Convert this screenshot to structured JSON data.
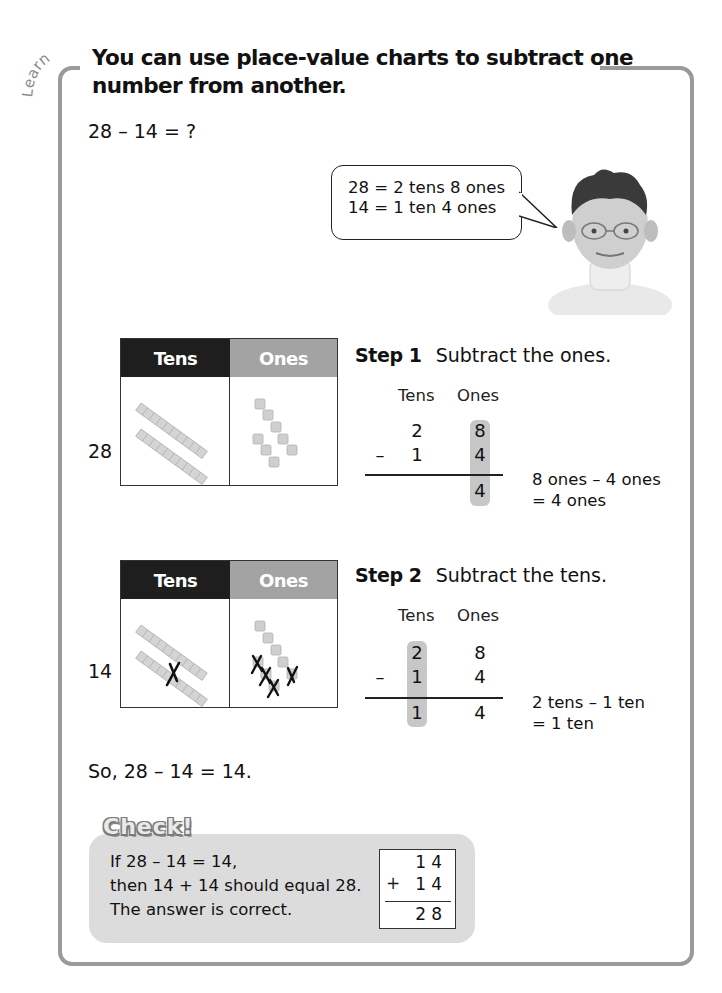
{
  "section_label": "Learn",
  "title": "You can use place-value charts to subtract one number from another.",
  "problem": "28 – 14 = ?",
  "speech_bubble": {
    "line1": "28 = 2 tens 8 ones",
    "line2": "14 = 1 ten 4 ones"
  },
  "charts": [
    {
      "number_label": "28",
      "header": {
        "tens": "Tens",
        "ones": "Ones"
      },
      "tens_rods": 2,
      "ones_cubes": 8,
      "crossed_tens": 0,
      "crossed_ones": 0
    },
    {
      "number_label": "14",
      "header": {
        "tens": "Tens",
        "ones": "Ones"
      },
      "tens_rods": 2,
      "ones_cubes": 8,
      "crossed_tens": 1,
      "crossed_ones": 4
    }
  ],
  "steps": [
    {
      "label": "Step 1",
      "instruction": "Subtract the ones.",
      "col_headers": {
        "tens": "Tens",
        "ones": "Ones"
      },
      "minus_sign": "–",
      "rows": {
        "top": [
          "2",
          "8"
        ],
        "bottom": [
          "1",
          "4"
        ],
        "result": [
          "",
          "4"
        ]
      },
      "highlight_column": "ones",
      "explain_line1": "8 ones – 4 ones",
      "explain_line2": "= 4 ones"
    },
    {
      "label": "Step 2",
      "instruction": "Subtract the tens.",
      "col_headers": {
        "tens": "Tens",
        "ones": "Ones"
      },
      "minus_sign": "–",
      "rows": {
        "top": [
          "2",
          "8"
        ],
        "bottom": [
          "1",
          "4"
        ],
        "result": [
          "1",
          "4"
        ]
      },
      "highlight_column": "tens",
      "explain_line1": "2 tens – 1 ten",
      "explain_line2": "= 1 ten"
    }
  ],
  "conclusion": "So, 28 – 14 = 14.",
  "check": {
    "title": "Check!",
    "line1": "If 28 – 14 = 14,",
    "line2": "then 14 + 14 should equal 28.",
    "line3": "The answer is correct.",
    "calc": {
      "addend1": "14",
      "plus": "+",
      "addend2": "14",
      "sum": "28"
    }
  },
  "colors": {
    "frame": "#9a9a9a",
    "tens_header": "#1e1e1e",
    "ones_header": "#a3a3a3",
    "highlight": "#c7c7c7",
    "check_bg": "#dcdcdc"
  }
}
